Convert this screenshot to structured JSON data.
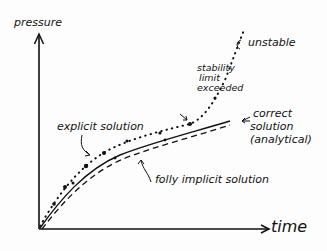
{
  "diagram": {
    "axes": {
      "y_label": "pressure",
      "x_label": "time"
    },
    "curves": [
      {
        "name": "correct solution (analytical)",
        "style": "solid"
      },
      {
        "name": "fully implicit solution",
        "style": "dashed"
      },
      {
        "name": "explicit solution",
        "style": "dotted"
      }
    ],
    "annotations": {
      "stability_line1": "stability",
      "stability_line2": "limit",
      "stability_line3": "exceeded",
      "unstable": "unstable",
      "correct_line1": "correct",
      "correct_line2": "solution",
      "correct_line3": "(analytical)",
      "explicit": "explicit solution",
      "implicit": "folly implicit solution"
    },
    "colors": {
      "ink": "#111111",
      "background": "#fdfdfd"
    }
  }
}
